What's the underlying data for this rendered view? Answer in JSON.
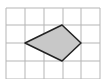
{
  "figure": {
    "grid": {
      "columns": 5,
      "rows": 4,
      "line_color": "#b5b5b5",
      "vertical_x": [
        6,
        25,
        44,
        63,
        81,
        100
      ],
      "horizontal_y": [
        8,
        25,
        43,
        61,
        79
      ]
    },
    "shape": {
      "type": "quadrilateral",
      "fill": "#c8c8c8",
      "stroke": "#222222",
      "vertices_grid": [
        [
          1,
          2
        ],
        [
          3,
          1
        ],
        [
          4,
          2
        ],
        [
          3,
          3
        ]
      ],
      "vertices_px": [
        [
          25,
          43
        ],
        [
          62,
          25
        ],
        [
          81,
          43
        ],
        [
          62,
          61
        ]
      ]
    }
  }
}
